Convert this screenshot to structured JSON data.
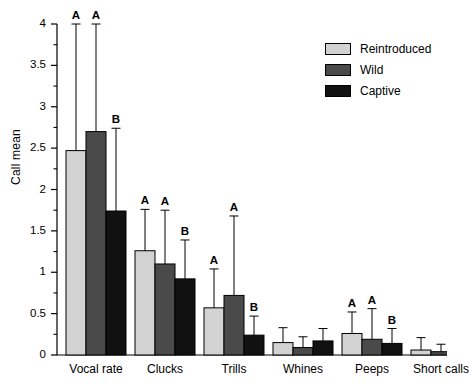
{
  "chart_data": {
    "type": "bar",
    "title": "",
    "xlabel": "",
    "ylabel": "Call mean",
    "ylim": [
      0,
      4
    ],
    "ytick_step": 0.5,
    "yminor_step": 0.25,
    "grid": false,
    "legend_position": "top-right",
    "categories": [
      "Vocal rate",
      "Clucks",
      "Trills",
      "Whines",
      "Peeps",
      "Short calls"
    ],
    "ytick_labels": [
      "0",
      "0.5",
      "1",
      "1.5",
      "2",
      "2.5",
      "3",
      "3.5",
      "4"
    ],
    "ytick_values": [
      0,
      0.5,
      1,
      1.5,
      2,
      2.5,
      3,
      3.5,
      4
    ],
    "series": [
      {
        "name": "Reintroduced",
        "color": "#d2d2d2",
        "values": [
          2.47,
          1.26,
          0.57,
          0.15,
          0.26,
          0.06
        ],
        "errors_upper": [
          4.0,
          1.76,
          1.04,
          0.33,
          0.52,
          0.21
        ],
        "sig_letters": [
          "A",
          "A",
          "A",
          "",
          "A",
          ""
        ]
      },
      {
        "name": "Wild",
        "color": "#4a4a4a",
        "values": [
          2.7,
          1.1,
          0.72,
          0.09,
          0.19,
          0.04
        ],
        "errors_upper": [
          4.0,
          1.75,
          1.68,
          0.22,
          0.56,
          0.13
        ],
        "sig_letters": [
          "A",
          "A",
          "A",
          "",
          "A",
          ""
        ]
      },
      {
        "name": "Captive",
        "color": "#111111",
        "values": [
          1.74,
          0.92,
          0.24,
          0.17,
          0.14,
          0.07
        ],
        "errors_upper": [
          2.74,
          1.39,
          0.47,
          0.32,
          0.32,
          0.2
        ],
        "sig_letters": [
          "B",
          "B",
          "B",
          "",
          "B",
          ""
        ]
      }
    ]
  },
  "legend": {
    "items": [
      {
        "label": "Reintroduced",
        "color": "#d2d2d2"
      },
      {
        "label": "Wild",
        "color": "#4a4a4a"
      },
      {
        "label": "Captive",
        "color": "#111111"
      }
    ]
  }
}
